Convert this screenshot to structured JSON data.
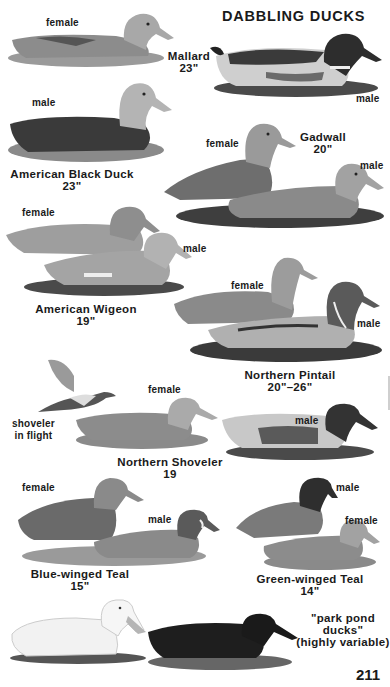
{
  "page": {
    "title": "DABBLING DUCKS",
    "page_number": "211"
  },
  "species": [
    {
      "name": "Mallard",
      "size": "23\"",
      "labels": [
        "female",
        "male"
      ]
    },
    {
      "name": "American Black Duck",
      "size": "23\"",
      "labels": [
        "male"
      ]
    },
    {
      "name": "Gadwall",
      "size": "20\"",
      "labels": [
        "female",
        "male"
      ]
    },
    {
      "name": "American Wigeon",
      "size": "19\"",
      "labels": [
        "female",
        "male"
      ]
    },
    {
      "name": "Northern Pintail",
      "size": "20\"–26\"",
      "labels": [
        "female",
        "male"
      ]
    },
    {
      "name": "Northern Shoveler",
      "size": "19",
      "labels": [
        "female",
        "male"
      ],
      "extra_label": "shoveler in flight"
    },
    {
      "name": "Blue-winged Teal",
      "size": "15\"",
      "labels": [
        "female",
        "male"
      ]
    },
    {
      "name": "Green-winged Teal",
      "size": "14\"",
      "labels": [
        "male",
        "female"
      ]
    },
    {
      "name": "\"park pond ducks\"",
      "size": "(highly variable)",
      "labels": []
    }
  ],
  "flight_label": {
    "line1": "shoveler",
    "line2": "in flight"
  },
  "park": {
    "line1": "\"park pond",
    "line2": "ducks\"",
    "line3": "(highly variable)"
  },
  "colors": {
    "text": "#1a1a1a",
    "background": "#ffffff",
    "ink_dark": "#2b2b2b",
    "ink_mid": "#7a7a7a",
    "ink_light": "#bdbdbd"
  }
}
